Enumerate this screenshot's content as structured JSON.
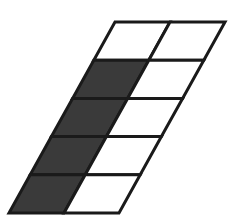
{
  "figure": {
    "name": "sheared-grid-diagram",
    "type": "parallelogram-grid",
    "rows": 5,
    "columns": 2,
    "background_color": "#ffffff",
    "outline_color": "#1a1a1a",
    "shaded_color": "#3a3a3a",
    "unshaded_color": "#ffffff",
    "outline_width": 3,
    "shaded_cell_count": 4,
    "unshaded_cell_count": 6,
    "total_cell_count": 10,
    "geometry": {
      "top_left": [
        115,
        22
      ],
      "top_right": [
        225,
        22
      ],
      "bottom_left": [
        9,
        213
      ],
      "bottom_right": [
        119,
        213
      ],
      "shear_dx": -106,
      "row_height": 38.2,
      "column_width": 55
    },
    "cells": [
      {
        "id": "r1c1",
        "row": 1,
        "column": 1,
        "state": "unshaded",
        "fill": "#ffffff"
      },
      {
        "id": "r1c2",
        "row": 1,
        "column": 2,
        "state": "unshaded",
        "fill": "#ffffff"
      },
      {
        "id": "r2c1",
        "row": 2,
        "column": 1,
        "state": "shaded",
        "fill": "#3a3a3a"
      },
      {
        "id": "r2c2",
        "row": 2,
        "column": 2,
        "state": "unshaded",
        "fill": "#ffffff"
      },
      {
        "id": "r3c1",
        "row": 3,
        "column": 1,
        "state": "shaded",
        "fill": "#3a3a3a"
      },
      {
        "id": "r3c2",
        "row": 3,
        "column": 2,
        "state": "unshaded",
        "fill": "#ffffff"
      },
      {
        "id": "r4c1",
        "row": 4,
        "column": 1,
        "state": "shaded",
        "fill": "#3a3a3a"
      },
      {
        "id": "r4c2",
        "row": 4,
        "column": 2,
        "state": "unshaded",
        "fill": "#ffffff"
      },
      {
        "id": "r5c1",
        "row": 5,
        "column": 1,
        "state": "shaded",
        "fill": "#3a3a3a"
      },
      {
        "id": "r5c2",
        "row": 5,
        "column": 2,
        "state": "unshaded",
        "fill": "#ffffff"
      }
    ]
  }
}
